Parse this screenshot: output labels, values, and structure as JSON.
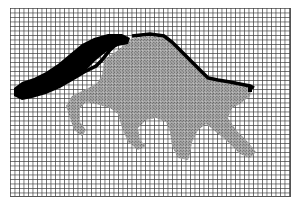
{
  "figure": {
    "grid": {
      "columns": 62,
      "rows": 42,
      "cell_px": 4.5,
      "line_color": "#3c3c3c",
      "background": "#ffffff"
    },
    "colors": {
      "tail": "#000000",
      "outline": "#000000",
      "body": "#8a8a8a",
      "body_dark": "#6e6e6e"
    }
  }
}
